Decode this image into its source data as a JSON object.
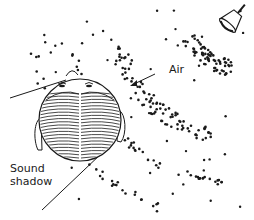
{
  "diagram": {
    "labels": {
      "air": "Air",
      "sound_shadow_line1": "Sound",
      "sound_shadow_line2": "shadow"
    },
    "colors": {
      "ink": "#1a1a1a",
      "background": "#ffffff"
    },
    "elements": [
      "bell (sound source)",
      "compressed wavefront bands of dots",
      "sparse air molecules",
      "head viewed from above with ears and nose",
      "arrow pointing toward head",
      "sound shadow boundary lines"
    ]
  }
}
